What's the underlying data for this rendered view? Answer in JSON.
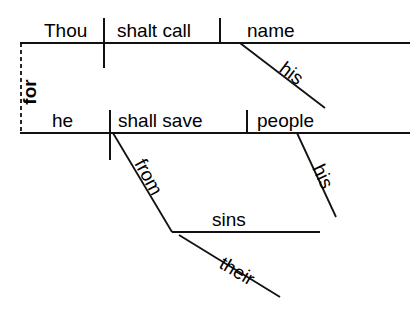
{
  "diagram": {
    "type": "reed-kellogg-sentence-diagram",
    "sentence": "Thou shalt call his name ... for he shall save his people from their sins",
    "background_color": "#ffffff",
    "line_color": "#111111",
    "text_color": "#000000",
    "clauses": [
      {
        "id": "clause-top",
        "role": "main-clause",
        "baseline": {
          "x1": 20,
          "y1": 43,
          "x2": 410,
          "y2": 43
        },
        "words": [
          {
            "id": "subject-thou",
            "label": "Thou",
            "role": "subject",
            "x": 44,
            "y": 37
          },
          {
            "id": "verb-shalt-call",
            "label": "shalt call",
            "role": "verb",
            "x": 117,
            "y": 37
          },
          {
            "id": "object-name",
            "label": "name",
            "role": "direct-object",
            "x": 247,
            "y": 37
          }
        ],
        "dividers": [
          {
            "id": "divider-subject-verb",
            "role": "subject-verb-divider",
            "x1": 104,
            "y1": 18,
            "x2": 104,
            "y2": 68,
            "crosses_baseline": true
          },
          {
            "id": "divider-verb-object",
            "role": "verb-object-divider",
            "x1": 220,
            "y1": 18,
            "x2": 220,
            "y2": 43,
            "crosses_baseline": false
          }
        ],
        "modifiers": [
          {
            "id": "modifier-his-name",
            "label": "his",
            "role": "possessive-modifier",
            "modifies": "name",
            "x1": 240,
            "y1": 43,
            "x2": 325,
            "y2": 108,
            "text_x": 278,
            "text_y": 71,
            "rotate": 37
          }
        ]
      },
      {
        "id": "clause-bottom",
        "role": "subordinate-clause",
        "baseline": {
          "x1": 20,
          "y1": 133,
          "x2": 410,
          "y2": 133
        },
        "words": [
          {
            "id": "subject-he",
            "label": "he",
            "role": "subject",
            "x": 52,
            "y": 127
          },
          {
            "id": "verb-shall-save",
            "label": "shall save",
            "role": "verb",
            "x": 118,
            "y": 127
          },
          {
            "id": "object-people",
            "label": "people",
            "role": "direct-object",
            "x": 257,
            "y": 127
          }
        ],
        "dividers": [
          {
            "id": "divider-subject-verb-2",
            "role": "subject-verb-divider",
            "x1": 110,
            "y1": 110,
            "x2": 110,
            "y2": 160,
            "crosses_baseline": true
          },
          {
            "id": "divider-verb-object-2",
            "role": "verb-object-divider",
            "x1": 247,
            "y1": 110,
            "x2": 247,
            "y2": 133,
            "crosses_baseline": false
          }
        ],
        "modifiers": [
          {
            "id": "modifier-his-people",
            "label": "his",
            "role": "possessive-modifier",
            "modifies": "people",
            "x1": 297,
            "y1": 133,
            "x2": 336,
            "y2": 217,
            "text_x": 312,
            "text_y": 168,
            "rotate": 65
          }
        ]
      }
    ],
    "conjunction": {
      "id": "conjunction-for",
      "label": "for",
      "role": "coordinating-conjunction",
      "orientation": "vertical-rotated",
      "dashed_line": {
        "x": 21,
        "y1": 43,
        "y2": 133
      },
      "text_x": 36,
      "text_y": 92,
      "rotate": -90
    },
    "prepositional_phrase": {
      "id": "phrase-from-their-sins",
      "preposition": {
        "id": "preposition-from",
        "label": "from",
        "x1": 113,
        "y1": 133,
        "x2": 172,
        "y2": 232,
        "text_x": 143,
        "text_y": 180,
        "rotate": 62
      },
      "object": {
        "id": "object-sins",
        "label": "sins",
        "line": {
          "x1": 172,
          "y1": 232,
          "x2": 320,
          "y2": 232
        },
        "text_x": 212,
        "text_y": 226
      },
      "modifier": {
        "id": "modifier-their-sins",
        "label": "their",
        "role": "possessive-modifier",
        "modifies": "sins",
        "x1": 179,
        "y1": 235,
        "x2": 280,
        "y2": 297,
        "text_x": 218,
        "text_y": 267,
        "rotate": 31
      }
    }
  }
}
